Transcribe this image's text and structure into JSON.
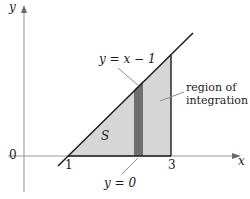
{
  "figure": {
    "type": "calculus-region-diagram",
    "background_color": "#ffffff",
    "axes": {
      "x_axis_label": "x",
      "y_axis_label": "y",
      "origin_label": "0",
      "axis_color": "#9a9a9a",
      "x_ticks": [
        "1",
        "3"
      ]
    },
    "labels": {
      "line_equation": "y = x − 1",
      "region_label": "S",
      "lower_bound": "y = 0",
      "region_of_integration_line1": "region of",
      "region_of_integration_line2": "integration"
    },
    "colors": {
      "region_fill": "#d6d6d6",
      "strip_fill": "#6e6e6e",
      "boundary_line": "#1c1c1c",
      "leader_line": "#7a7a7a"
    },
    "geometry": {
      "x_intercept": 1,
      "x_right_bound": 3,
      "slope": 1,
      "intercept": -1,
      "strip_x_left": 2.28,
      "strip_x_right": 2.45
    }
  }
}
